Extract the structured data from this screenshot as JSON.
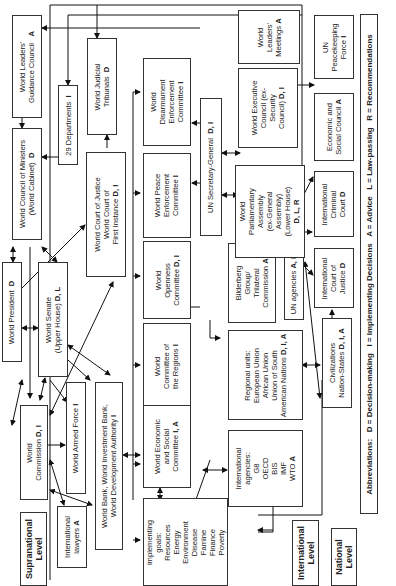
{
  "boxes": {
    "leaders_council": {
      "label": "World Leaders'\nGuidance Council",
      "code": "A"
    },
    "council_ministers": {
      "label": "World Council of Ministers\n(World Cabinet)",
      "code": "D"
    },
    "departments": {
      "label": "29 Departments",
      "code": "I"
    },
    "judicial_tribunals": {
      "label": "World Judicial\nTribunals",
      "code": "D"
    },
    "court_justice": {
      "label": "World Court of Justice\nWorld Court of\nFirst Instance",
      "code": "D, I"
    },
    "disarmament": {
      "label": "World\nDisarmament\nEnforcement\nCommittee",
      "code": "I"
    },
    "peace_enforcement": {
      "label": "World Peace\nEnforcement\nCommittee",
      "code": "I"
    },
    "openness": {
      "label": "World\nOpenness\nCommittee",
      "code": "D, I"
    },
    "regions": {
      "label": "World\nCommittee of\nthe Regions",
      "code": "I"
    },
    "econ_social_committee": {
      "label": "World Economic\nand Social\nCommittee",
      "code": "I, A"
    },
    "implementing_committees": {
      "label": "Committees for\nimplementing\ngoals:\nResources\nEnergy\nEnvironment\nDisease\nFamine\nFinance\nPoverty\nPopulation",
      "code": "I, A"
    },
    "un_secretary_general": {
      "label": "UN Secretary-General",
      "code": "D, I"
    },
    "bilderberg": {
      "label": "Bilderberg\nGroup/\nTrilateral\nCommission",
      "code": "A"
    },
    "un_agencies": {
      "label": "UN agencies",
      "code": "A, I"
    },
    "regional_units": {
      "label": "Regional units:\nEuropean Union\nAfrican Union\nUnion of South\nAmerican Nations",
      "code": "D, I, A"
    },
    "intl_agencies": {
      "label": "International\nagencies:\nG8\nOECD\nBIS\nIMF\nWTO",
      "code": "A"
    },
    "leaders_meetings": {
      "label": "World\nLeaders'\nMeetings",
      "code": "A"
    },
    "executive_council": {
      "label": "World Executive\nCouncil (ex-\nSecurity\nCouncil)",
      "code": "D, I"
    },
    "parliamentary_assembly": {
      "label": "World\nParliamentary\nAssembly\n(ex-General\nAssembly)\n(Lower House)",
      "code": "D, L, R"
    },
    "civilizations": {
      "label": "Civilizations\nNation-States",
      "code": "D, I, A"
    },
    "peacekeeping": {
      "label": "UN\nPeacekeeping\nForce",
      "code": "I"
    },
    "econ_social_council": {
      "label": "Economic and\nSocial Council",
      "code": "A"
    },
    "criminal_court": {
      "label": "International\nCriminal\nCourt",
      "code": "D"
    },
    "intl_court_justice": {
      "label": "International\nCourt of\nJustice",
      "code": "D"
    },
    "world_president": {
      "label": "World President",
      "code": "D"
    },
    "world_senate": {
      "label": "World Senate\n(Upper House)",
      "code": "D, L"
    },
    "world_commission": {
      "label": "World\nCommission",
      "code": "D, I"
    },
    "armed_force": {
      "label": "World Armed Force",
      "code": "I"
    },
    "world_bank": {
      "label": "World Bank, World Investment Bank,\nWorld Development Authority",
      "code": "I"
    },
    "intl_lawyers": {
      "label": "International\nlawyers",
      "code": "A"
    }
  },
  "levels": {
    "supranational": "Supranational\nLevel",
    "international": "International\nLevel",
    "national": "National\nLevel"
  },
  "legend": {
    "text": "Abbreviations:   D = Decision-making   I = Implementing Decisions   A = Advice   L = Law-passing   R = Recommendations"
  }
}
